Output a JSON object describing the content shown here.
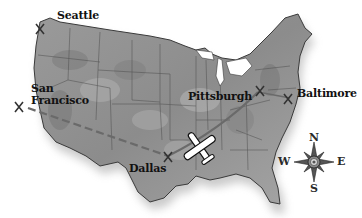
{
  "map": {
    "title": "United States route map",
    "style": "grayscale relief",
    "colors": {
      "land": "#8a8a8a",
      "land_light": "#b5b5b5",
      "border": "#4a4a4a",
      "shadow": "#bdbdbd",
      "text": "#111111",
      "route": "#6a6a6a"
    }
  },
  "cities": [
    {
      "name": "Seattle",
      "marker": "x-marker"
    },
    {
      "name": "San",
      "name2": "Francisco",
      "marker": "x-marker"
    },
    {
      "name": "Pittsburgh",
      "marker": "x-marker"
    },
    {
      "name": "Baltimore",
      "marker": "x-marker"
    },
    {
      "name": "Dallas",
      "marker": "x-marker"
    }
  ],
  "routes": [
    {
      "from": "San Francisco",
      "to": "Dallas",
      "style": "dashed"
    },
    {
      "from": "Dallas",
      "to": "Pittsburgh",
      "style": "solid"
    },
    {
      "from": "Pittsburgh",
      "to": "Baltimore",
      "style": "solid"
    }
  ],
  "airplane": {
    "icon": "airplane-icon"
  },
  "compass": {
    "icon": "compass-rose-icon",
    "n": "N",
    "s": "S",
    "e": "E",
    "w": "W"
  }
}
